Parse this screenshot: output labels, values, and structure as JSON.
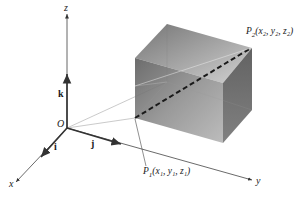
{
  "figure": {
    "type": "3d-coordinate-diagram"
  },
  "axes": {
    "x": {
      "label": "x"
    },
    "y": {
      "label": "y"
    },
    "z": {
      "label": "z"
    }
  },
  "origin": {
    "label": "O"
  },
  "unit_vectors": {
    "i": {
      "label": "i"
    },
    "j": {
      "label": "j"
    },
    "k": {
      "label": "k"
    }
  },
  "points": {
    "p1": {
      "name": "P",
      "sub": "1",
      "coords": "(x₁, y₁, z₁)"
    },
    "p2": {
      "name": "P",
      "sub": "2",
      "coords": "(x₂, y₂, z₂)"
    }
  },
  "colors": {
    "axis": "#333333",
    "box_dark": "#5a5a5a",
    "box_mid": "#8a8a8a",
    "box_light": "#c8c8c8",
    "diagonal": "#1a1a1a",
    "guide_lines": "#bbbbbb"
  }
}
